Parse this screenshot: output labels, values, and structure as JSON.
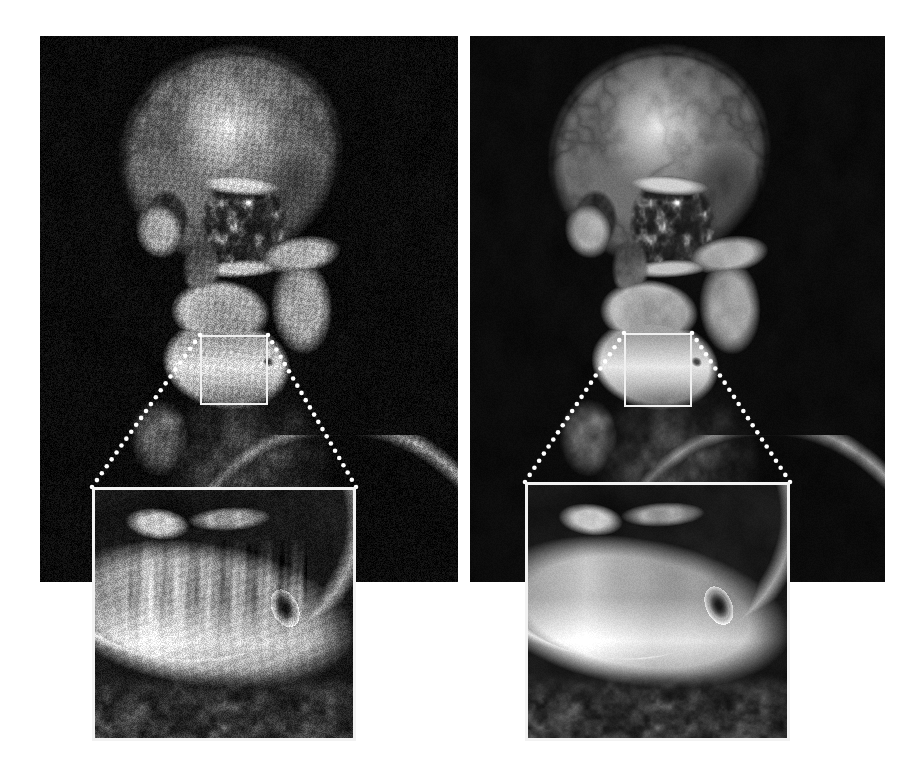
{
  "figure": {
    "kind": "medical-image-comparison",
    "modality": "CT",
    "rendering": "3D volume rendering",
    "anatomy": "skull and mandible, anterior-oblique view",
    "layout": "two panels side by side, each with magnified inset below",
    "background_color": "#ffffff",
    "panel_background_color": "#000000",
    "annotation_color": "#f0f0f0",
    "width": 917,
    "height": 774
  },
  "panels": [
    {
      "id": "left",
      "role": "before",
      "description": "Noisy 3D volume rendered skull with streak and speckle artifacts over the mandible",
      "noise_level": 0.42,
      "grain_scale": 1.0,
      "streaks": true,
      "x": 40,
      "y": 36,
      "width": 418,
      "height": 546,
      "roi": {
        "x": 200,
        "y": 335,
        "width": 68,
        "height": 70
      },
      "inset": {
        "x": 92,
        "y": 487,
        "width": 264,
        "height": 254
      },
      "leaders": [
        {
          "from_x": 200,
          "from_y": 335,
          "to_x": 92,
          "to_y": 487
        },
        {
          "from_x": 268,
          "from_y": 335,
          "to_x": 356,
          "to_y": 487
        }
      ]
    },
    {
      "id": "right",
      "role": "after",
      "description": "Denoised 3D volume rendered skull with smooth mandible surface and preserved mental foramen",
      "noise_level": 0.1,
      "grain_scale": 1.0,
      "streaks": false,
      "x": 470,
      "y": 36,
      "width": 415,
      "height": 546,
      "roi": {
        "x": 624,
        "y": 333,
        "width": 68,
        "height": 74
      },
      "inset": {
        "x": 525,
        "y": 482,
        "width": 265,
        "height": 259
      },
      "leaders": [
        {
          "from_x": 624,
          "from_y": 333,
          "to_x": 525,
          "to_y": 482
        },
        {
          "from_x": 692,
          "from_y": 333,
          "to_x": 790,
          "to_y": 482
        }
      ]
    }
  ],
  "leader_style": {
    "dot_color": "#ffffff",
    "dot_radius": 2.3,
    "dot_spacing": 8.5
  },
  "skull_geometry": {
    "cranium": {
      "cx": 0.455,
      "cy": 0.215,
      "rx": 0.275,
      "ry": 0.205,
      "rot": -0.1
    },
    "forehead_highlight": {
      "cx": 0.455,
      "cy": 0.165,
      "r": 0.135,
      "intensity": 0.98
    },
    "orbit_left": {
      "cx": 0.3,
      "cy": 0.335,
      "rx": 0.055,
      "ry": 0.055
    },
    "orbit_right": {
      "cx": 0.485,
      "cy": 0.345,
      "rx": 0.105,
      "ry": 0.092
    },
    "nasal": {
      "cx": 0.385,
      "cy": 0.425,
      "rx": 0.045,
      "ry": 0.055
    },
    "maxilla": {
      "cx": 0.43,
      "cy": 0.505,
      "rx": 0.12,
      "ry": 0.06
    },
    "mandible": {
      "cx": 0.445,
      "cy": 0.6,
      "rx": 0.155,
      "ry": 0.085
    },
    "neck": {
      "cx": 0.5,
      "cy": 0.8,
      "rx": 0.2,
      "ry": 0.2
    },
    "zygomatic_arch": {
      "cx": 0.62,
      "cy": 0.4,
      "rx": 0.1,
      "ry": 0.035
    },
    "mental_foramen": {
      "cx": 0.545,
      "cy": 0.596,
      "rx": 0.013,
      "ry": 0.009
    }
  },
  "inset_geometry": {
    "mandible_body": {
      "cx": 0.42,
      "cy": 0.5,
      "rx": 0.62,
      "ry": 0.3,
      "rot": 0.16
    },
    "ramus_shadow": {
      "cx": 0.12,
      "cy": 0.2
    },
    "teeth_row": {
      "x0": 0.18,
      "x1": 0.72,
      "y": 0.4,
      "count": 9
    },
    "foramen": {
      "cx": 0.735,
      "cy": 0.475,
      "rx": 0.035,
      "ry": 0.055
    },
    "inferior_border_highlight": {
      "y": 0.66
    },
    "soft_tissue_band": {
      "y0": 0.8,
      "y1": 1.0
    }
  }
}
